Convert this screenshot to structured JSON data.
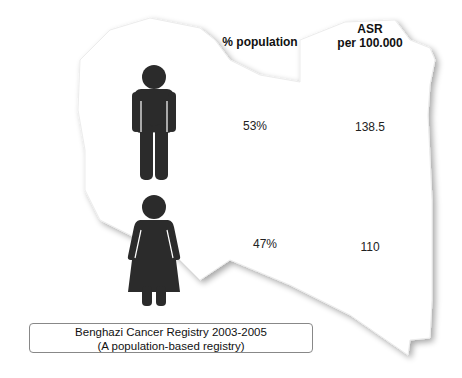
{
  "header": {
    "population_label": "% population",
    "asr_label_line1": "ASR",
    "asr_label_line2": "per 100.000"
  },
  "rows": [
    {
      "sex": "male",
      "icon": "man-icon",
      "population_pct": "53%",
      "asr": "138.5"
    },
    {
      "sex": "female",
      "icon": "woman-icon",
      "population_pct": "47%",
      "asr": "110"
    }
  ],
  "legend": {
    "line1": "Benghazi Cancer Registry 2003-2005",
    "line2": "(A population-based registry)"
  },
  "colors": {
    "figure": "#2b2b2b",
    "map_fill": "#ffffff",
    "map_shadow": "#b8b8b8"
  }
}
